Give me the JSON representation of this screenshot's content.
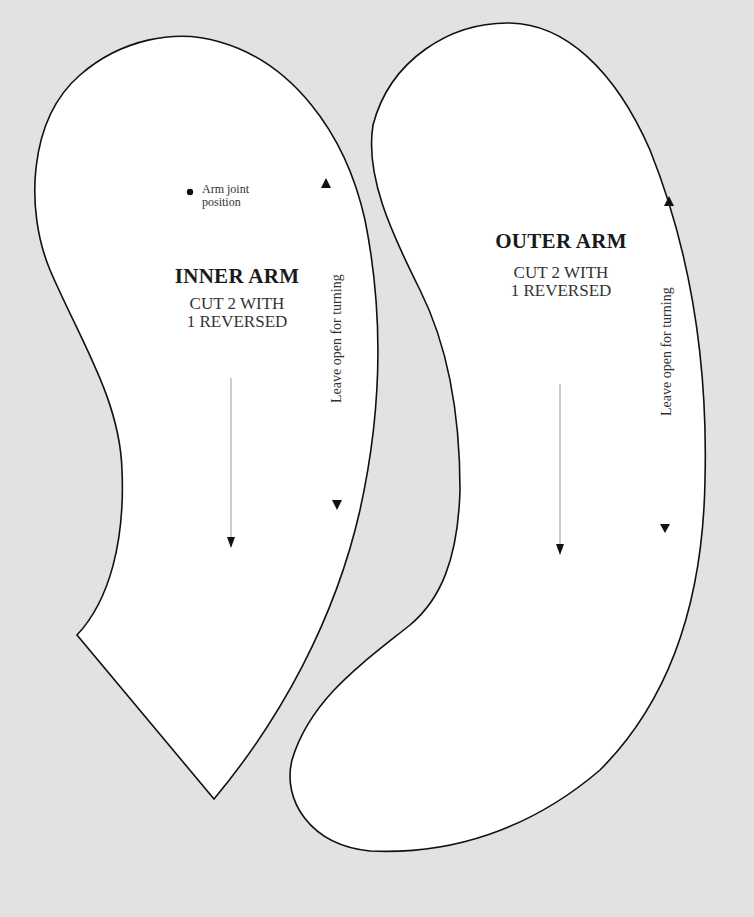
{
  "pieces": [
    {
      "name": "INNER ARM",
      "instruction_line1": "CUT 2 WITH",
      "instruction_line2": "1 REVERSED",
      "opening_note": "Leave open for turning",
      "joint_note_line1": "Arm joint",
      "joint_note_line2": "position"
    },
    {
      "name": "OUTER ARM",
      "instruction_line1": "CUT 2 WITH",
      "instruction_line2": "1 REVERSED",
      "opening_note": "Leave open for turning"
    }
  ],
  "colors": {
    "background": "#e2e2e2",
    "piece_fill": "#ffffff",
    "outline": "#111111",
    "grainline": "#999999"
  }
}
